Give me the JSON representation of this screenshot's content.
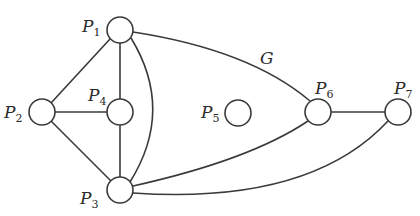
{
  "diagram": {
    "graph_name": "G",
    "nodes": [
      {
        "id": "P1",
        "letter": "P",
        "sub": "1",
        "x": 120,
        "y": 30
      },
      {
        "id": "P2",
        "letter": "P",
        "sub": "2",
        "x": 42,
        "y": 112
      },
      {
        "id": "P3",
        "letter": "P",
        "sub": "3",
        "x": 120,
        "y": 190
      },
      {
        "id": "P4",
        "letter": "P",
        "sub": "4",
        "x": 120,
        "y": 112
      },
      {
        "id": "P5",
        "letter": "P",
        "sub": "5",
        "x": 238,
        "y": 113
      },
      {
        "id": "P6",
        "letter": "P",
        "sub": "6",
        "x": 318,
        "y": 112
      },
      {
        "id": "P7",
        "letter": "P",
        "sub": "7",
        "x": 398,
        "y": 112
      }
    ],
    "edges": [
      [
        "P1",
        "P2"
      ],
      [
        "P1",
        "P4"
      ],
      [
        "P1",
        "P3"
      ],
      [
        "P1",
        "P6"
      ],
      [
        "P2",
        "P4"
      ],
      [
        "P2",
        "P3"
      ],
      [
        "P4",
        "P3"
      ],
      [
        "P3",
        "P6"
      ],
      [
        "P3",
        "P7"
      ],
      [
        "P6",
        "P7"
      ]
    ]
  }
}
